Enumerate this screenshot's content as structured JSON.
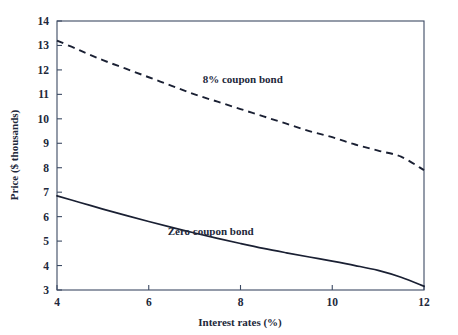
{
  "chart_data": {
    "type": "line",
    "title": "",
    "xlabel": "Interest rates (%)",
    "ylabel": "Price ($ thousands)",
    "xlim": [
      4,
      12
    ],
    "ylim": [
      3,
      14
    ],
    "xticks": [
      "4",
      "6",
      "8",
      "10",
      "12"
    ],
    "xtick_values": [
      4,
      6,
      8,
      10,
      12
    ],
    "yticks": [
      "3",
      "4",
      "5",
      "6",
      "7",
      "8",
      "9",
      "10",
      "11",
      "12",
      "13",
      "14"
    ],
    "ytick_values": [
      3,
      4,
      5,
      6,
      7,
      8,
      9,
      10,
      11,
      12,
      13,
      14
    ],
    "grid": false,
    "legend_position": "inline-annotation",
    "series": [
      {
        "name": "8% coupon bond",
        "style": "dashed",
        "color": "#1a2033",
        "label_x": 8.05,
        "label_y": 11.45,
        "x": [
          4.0,
          4.5,
          5.0,
          5.5,
          6.0,
          6.5,
          7.0,
          7.5,
          8.0,
          8.5,
          9.0,
          9.5,
          10.0,
          10.5,
          11.0,
          11.5,
          12.0
        ],
        "values": [
          13.2,
          12.8,
          12.4,
          12.05,
          11.7,
          11.35,
          11.0,
          10.7,
          10.4,
          10.1,
          9.8,
          9.5,
          9.25,
          8.95,
          8.7,
          8.45,
          7.9
        ]
      },
      {
        "name": "Zero coupon bond",
        "style": "solid",
        "color": "#1a2033",
        "label_x": 7.35,
        "label_y": 5.25,
        "x": [
          4.0,
          4.5,
          5.0,
          5.5,
          6.0,
          6.5,
          7.0,
          7.5,
          8.0,
          8.5,
          9.0,
          9.5,
          10.0,
          10.5,
          11.0,
          11.5,
          12.0
        ],
        "values": [
          6.85,
          6.58,
          6.31,
          6.05,
          5.8,
          5.56,
          5.33,
          5.11,
          4.9,
          4.7,
          4.52,
          4.35,
          4.18,
          4.0,
          3.8,
          3.52,
          3.15
        ]
      }
    ]
  }
}
